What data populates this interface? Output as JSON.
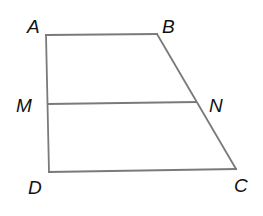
{
  "figure": {
    "type": "trapezoid with midline",
    "line_color": "#7a7a7a",
    "label_color": "#111111",
    "vertices": [
      {
        "name": "A",
        "label": "A",
        "x": 46,
        "y": 35,
        "label_x": 27,
        "label_y": 33
      },
      {
        "name": "B",
        "label": "B",
        "x": 157,
        "y": 34,
        "label_x": 162,
        "label_y": 33
      },
      {
        "name": "C",
        "label": "C",
        "x": 236,
        "y": 169,
        "label_x": 234,
        "label_y": 192
      },
      {
        "name": "D",
        "label": "D",
        "x": 49,
        "y": 172,
        "label_x": 28,
        "label_y": 194
      },
      {
        "name": "M",
        "label": "M",
        "x": 48,
        "y": 104,
        "label_x": 16,
        "label_y": 112
      },
      {
        "name": "N",
        "label": "N",
        "x": 196,
        "y": 102,
        "label_x": 209,
        "label_y": 112
      }
    ],
    "segments": [
      {
        "name": "AB",
        "from": "A",
        "to": "B"
      },
      {
        "name": "BC",
        "from": "B",
        "to": "C"
      },
      {
        "name": "CD",
        "from": "C",
        "to": "D"
      },
      {
        "name": "DA",
        "from": "D",
        "to": "A"
      },
      {
        "name": "MN",
        "from": "M",
        "to": "N"
      }
    ]
  }
}
